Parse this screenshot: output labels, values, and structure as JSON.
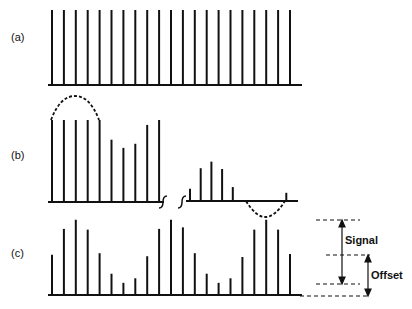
{
  "figure": {
    "panels": [
      {
        "id": "a",
        "label": "(a)"
      },
      {
        "id": "b",
        "label": "(b)"
      },
      {
        "id": "c",
        "label": "(c)"
      }
    ],
    "annotations": {
      "signal": "Signal",
      "offset": "Offset"
    }
  },
  "diagram": {
    "panel_a": {
      "description": "Uniform pulse train, 21 equal-height impulses",
      "bar_count": 21,
      "bar_height_relative": 1.0
    },
    "panel_b": {
      "description": "Clipped samples with dashed envelope above (saturation) and below (cut-off) with axis break",
      "left_segment_relative_heights": [
        1.0,
        1.0,
        1.0,
        1.0,
        1.0,
        0.76,
        0.66,
        0.71,
        0.94,
        1.0
      ],
      "right_segment_relative_heights": [
        0.15,
        0.4,
        0.48,
        0.39,
        0.17,
        0,
        0,
        0,
        0,
        0.1
      ]
    },
    "panel_c": {
      "description": "Sampled sinusoid riding on DC offset",
      "relative_heights": [
        0.53,
        0.87,
        0.99,
        0.86,
        0.55,
        0.28,
        0.16,
        0.22,
        0.51,
        0.87,
        0.99,
        0.89,
        0.55,
        0.28,
        0.16,
        0.22,
        0.5,
        0.86,
        0.99,
        0.86,
        0.54
      ]
    }
  }
}
